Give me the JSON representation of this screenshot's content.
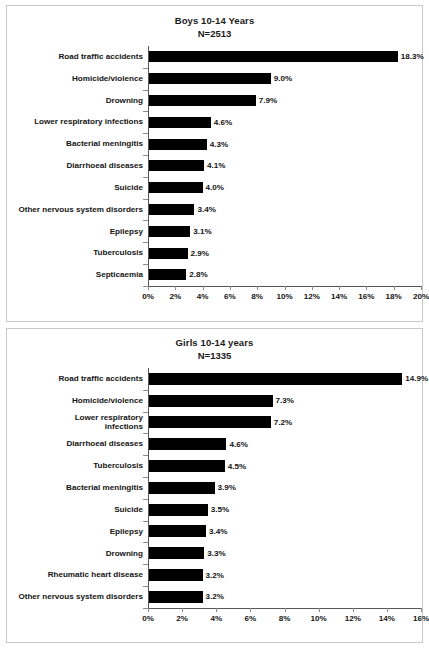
{
  "chart_data": [
    {
      "type": "bar",
      "orientation": "horizontal",
      "title": "Boys 10-14 Years",
      "subtitle": "N=2513",
      "sample_size": 2513,
      "xlabel": "",
      "ylabel": "",
      "grid": false,
      "legend": "none",
      "xlim": [
        0,
        20
      ],
      "xticks": [
        0,
        2,
        4,
        6,
        8,
        10,
        12,
        14,
        16,
        18,
        20
      ],
      "xticklabels": [
        "0%",
        "2%",
        "4%",
        "6%",
        "8%",
        "10%",
        "12%",
        "14%",
        "16%",
        "18%",
        "20%"
      ],
      "bar_color": "#000000",
      "categories": [
        "Road traffic accidents",
        "Homicide/violence",
        "Drowning",
        "Lower respiratory infections",
        "Bacterial meningitis",
        "Diarrhoeal diseases",
        "Suicide",
        "Other nervous system disorders",
        "Epilepsy",
        "Tuberculosis",
        "Septicaemia"
      ],
      "values": [
        18.3,
        9.0,
        7.9,
        4.6,
        4.3,
        4.1,
        4.0,
        3.4,
        3.1,
        2.9,
        2.8
      ],
      "data_labels": [
        "18.3%",
        "9.0%",
        "7.9%",
        "4.6%",
        "4.3%",
        "4.1%",
        "4.0%",
        "3.4%",
        "3.1%",
        "2.9%",
        "2.8%"
      ]
    },
    {
      "type": "bar",
      "orientation": "horizontal",
      "title": "Girls 10-14 years",
      "subtitle": "N=1335",
      "sample_size": 1335,
      "xlabel": "",
      "ylabel": "",
      "grid": false,
      "legend": "none",
      "xlim": [
        0,
        16
      ],
      "xticks": [
        0,
        2,
        4,
        6,
        8,
        10,
        12,
        14,
        16
      ],
      "xticklabels": [
        "0%",
        "2%",
        "4%",
        "6%",
        "8%",
        "10%",
        "12%",
        "14%",
        "16%"
      ],
      "bar_color": "#000000",
      "categories": [
        "Road traffic accidents",
        "Homicide/violence",
        "Lower respiratory\ninfections",
        "Diarrhoeal diseases",
        "Tuberculosis",
        "Bacterial meningitis",
        "Suicide",
        "Epilepsy",
        "Drowning",
        "Rheumatic heart disease",
        "Other nervous system disorders"
      ],
      "values": [
        14.9,
        7.3,
        7.2,
        4.6,
        4.5,
        3.9,
        3.5,
        3.4,
        3.3,
        3.2,
        3.2
      ],
      "data_labels": [
        "14.9%",
        "7.3%",
        "7.2%",
        "4.6%",
        "4.5%",
        "3.9%",
        "3.5%",
        "3.4%",
        "3.3%",
        "3.2%",
        "3.2%"
      ]
    }
  ]
}
